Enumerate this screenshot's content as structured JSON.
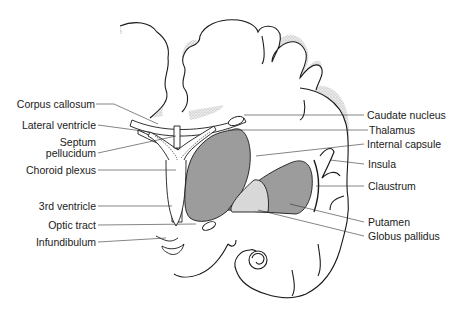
{
  "diagram": {
    "labels_left": [
      {
        "id": "corpus-callosum",
        "text": "Corpus callosum"
      },
      {
        "id": "lateral-ventricle",
        "text": "Lateral ventricle"
      },
      {
        "id": "septum-pellucidum-1",
        "text": "Septum"
      },
      {
        "id": "septum-pellucidum-2",
        "text": "pellucidum"
      },
      {
        "id": "choroid-plexus",
        "text": "Choroid plexus"
      },
      {
        "id": "third-ventricle",
        "text": "3rd ventricle"
      },
      {
        "id": "optic-tract",
        "text": "Optic tract"
      },
      {
        "id": "infundibulum",
        "text": "Infundibulum"
      }
    ],
    "labels_right": [
      {
        "id": "caudate-nucleus",
        "text": "Caudate nucleus"
      },
      {
        "id": "thalamus",
        "text": "Thalamus"
      },
      {
        "id": "internal-capsule",
        "text": "Internal capsule"
      },
      {
        "id": "insula",
        "text": "Insula"
      },
      {
        "id": "claustrum",
        "text": "Claustrum"
      },
      {
        "id": "putamen",
        "text": "Putamen"
      },
      {
        "id": "globus-pallidus",
        "text": "Globus pallidus"
      }
    ],
    "colors": {
      "outline": "#1a1a1a",
      "thalamus_fill": "#9a9a9a",
      "putamen_fill": "#8f8f8f",
      "globus_pallidus_fill": "#d6d6d6",
      "gray_matter_stipple": "#bdbdbd"
    }
  }
}
